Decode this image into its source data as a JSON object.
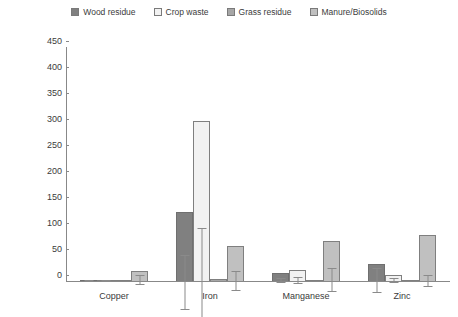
{
  "chart_data": {
    "type": "bar",
    "title": "",
    "xlabel": "",
    "ylabel": "Concentration (mg available nutrient kg⁻¹)",
    "ylim": [
      0,
      450
    ],
    "ytick_step": 50,
    "yticks": [
      450,
      400,
      350,
      300,
      250,
      200,
      150,
      100,
      50,
      0
    ],
    "ytick_labels": [
      "450",
      "400",
      "350",
      "300",
      "250",
      "200",
      "150",
      "100",
      "50",
      "0"
    ],
    "grid": false,
    "legend_position": "top-center",
    "error_bars": "symmetric-range",
    "categories": [
      "Copper",
      "Iron",
      "Manganese",
      "Zinc"
    ],
    "series": [
      {
        "name": "Wood residue",
        "color": "#808080",
        "border": "#6f6f6f",
        "values": [
          1,
          133,
          16,
          33
        ],
        "err_low": [
          1,
          78,
          13,
          10
        ],
        "err_high": [
          2,
          182,
          19,
          57
        ]
      },
      {
        "name": "Crop waste",
        "color": "#f2f2f2",
        "border": "#7f7f7f",
        "values": [
          2,
          308,
          22,
          11
        ],
        "err_low": [
          1,
          212,
          16,
          8
        ],
        "err_high": [
          3,
          408,
          28,
          15
        ]
      },
      {
        "name": "Grass residue",
        "color": "#a6a6a6",
        "border": "#7f7f7f",
        "values": [
          0.5,
          3,
          2,
          1
        ],
        "err_low": [
          0.5,
          3,
          2,
          1
        ],
        "err_high": [
          0.5,
          3,
          2,
          1
        ]
      },
      {
        "name": "Manure/Biosolids",
        "color": "#c0c0c0",
        "border": "#7f7f7f",
        "values": [
          20,
          67,
          77,
          88
        ],
        "err_low": [
          13,
          48,
          55,
          77
        ],
        "err_high": [
          29,
          85,
          101,
          98
        ]
      }
    ]
  },
  "legend": {
    "items": [
      {
        "label": "Wood residue",
        "color": "#808080"
      },
      {
        "label": "Crop waste",
        "color": "#f2f2f2"
      },
      {
        "label": "Grass residue",
        "color": "#a6a6a6"
      },
      {
        "label": "Manure/Biosolids",
        "color": "#c0c0c0"
      }
    ]
  }
}
